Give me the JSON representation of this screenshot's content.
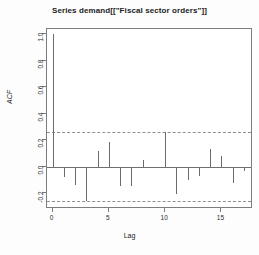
{
  "chart_data": {
    "type": "bar",
    "title": "Series  demand[[\"Fiscal sector orders\"]]",
    "xlabel": "Lag",
    "ylabel": "ACF",
    "grid": false,
    "legend": "none",
    "xlim": [
      -0.5,
      17.8
    ],
    "ylim": [
      -0.32,
      1.04
    ],
    "xticks": [
      0,
      5,
      10,
      15
    ],
    "xtick_labels": [
      "0",
      "5",
      "10",
      "15"
    ],
    "yticks": [
      1.0,
      0.8,
      0.6,
      0.4,
      0.2,
      0.0,
      -0.2
    ],
    "ytick_labels": [
      "1.0",
      "0.8",
      "0.6",
      "0.4",
      "0.2",
      "0.0",
      "-0.2"
    ],
    "confidence_bounds": [
      0.26,
      -0.26
    ],
    "categories": [
      0,
      1,
      2,
      3,
      4,
      5,
      6,
      7,
      8,
      9,
      10,
      11,
      12,
      13,
      14,
      15,
      16,
      17
    ],
    "values": [
      1.0,
      -0.08,
      -0.14,
      -0.26,
      0.12,
      0.19,
      -0.15,
      -0.15,
      0.05,
      -0.01,
      0.26,
      -0.21,
      -0.1,
      -0.07,
      0.13,
      0.08,
      -0.12,
      -0.03
    ]
  }
}
